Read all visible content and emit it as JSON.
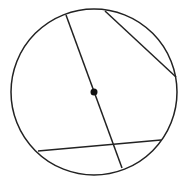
{
  "diagram": {
    "stroke_color": "#222222",
    "background": "#ffffff",
    "circle": {
      "cx": 94,
      "cy": 92,
      "r": 83
    },
    "center_point": {
      "cx": 94,
      "cy": 92,
      "r": 3.5
    },
    "diameter": {
      "x1": 66,
      "y1": 15,
      "x2": 122,
      "y2": 168
    },
    "chords": [
      {
        "x1": 105,
        "y1": 11,
        "x2": 176,
        "y2": 77
      },
      {
        "x1": 38,
        "y1": 151,
        "x2": 161,
        "y2": 140
      }
    ]
  }
}
